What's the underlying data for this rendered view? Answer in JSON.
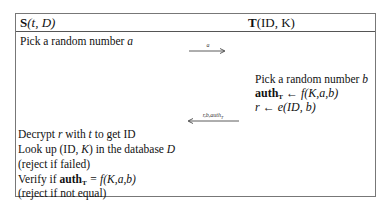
{
  "header": {
    "left_label": "S",
    "left_args": "(t, D)",
    "right_label": "T",
    "right_args": "(ID, K)"
  },
  "server_steps_top": {
    "pick_a": "Pick a random number",
    "var_a": "a"
  },
  "messages": [
    {
      "direction": "right",
      "label": "a"
    },
    {
      "direction": "left",
      "label": "r,b,auth_T"
    }
  ],
  "tag_steps": {
    "pick_b": "Pick a random number",
    "var_b": "b",
    "auth_lhs": "auth",
    "auth_sub": "T",
    "auth_rhs": "← f(K,a,b)",
    "r_line": "r ← e(ID, b)"
  },
  "server_steps_bottom": [
    "Decrypt r with t to get ID",
    "Look up (ID, K) in the database D",
    "(reject if failed)",
    "Verify if auth_T = f(K,a,b)",
    "(reject if not equal)"
  ],
  "server_bottom_parts": {
    "decrypt_1": "Decrypt",
    "decrypt_r": "r",
    "decrypt_2": "with",
    "decrypt_t": "t",
    "decrypt_3": "to get ID",
    "lookup_1": "Look up (ID,",
    "lookup_K": "K",
    "lookup_2": ") in the database",
    "lookup_D": "D",
    "reject_failed": "(reject if failed)",
    "verify_1": "Verify if",
    "verify_auth": "auth",
    "verify_sub": "T",
    "verify_2": "= f(K,a,b)",
    "reject_not_equal": "(reject if not equal)"
  },
  "arrow_labels": {
    "a": "a",
    "back": "r,b,auth"
  },
  "colors": {
    "border": "#777777",
    "text": "#111111",
    "background": "#ffffff"
  }
}
